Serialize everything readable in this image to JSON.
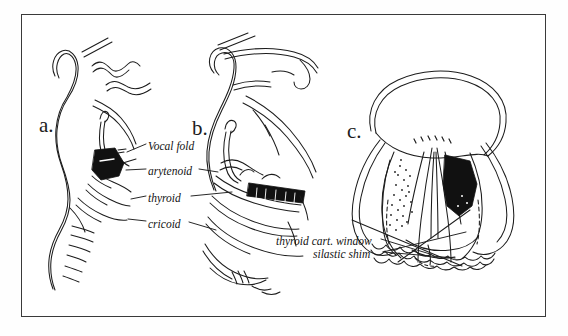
{
  "figure": {
    "domain": "medical-illustration",
    "background_color": "#ffffff",
    "frame_color": "#3a3a3a",
    "ink_color": "#1c1c1c",
    "fill_color": "#111111"
  },
  "panels": [
    {
      "id": "a",
      "letter": "a.",
      "view": "sagittal-small",
      "description": "Midsagittal section of head and neck showing larynx with darkened arytenoid region"
    },
    {
      "id": "b",
      "letter": "b.",
      "view": "sagittal-large",
      "description": "Enlarged sagittal view of the larynx with black rectangular thyroid cartilage window implant"
    },
    {
      "id": "c",
      "letter": "c.",
      "view": "superior",
      "description": "Superior (top-down) view of the larynx showing vocal folds, stippled left fold and solid black silastic shim on the right"
    }
  ],
  "annotations": [
    {
      "id": "vocal-fold",
      "text": "Vocal fold",
      "points_to": "panel-a-arytenoid"
    },
    {
      "id": "arytenoid",
      "text": "arytenoid",
      "points_to": "panel-a-arytenoid"
    },
    {
      "id": "thyroid",
      "text": "thyroid",
      "points_to": "panel-b-thyroid-cartilage"
    },
    {
      "id": "cricoid",
      "text": "cricoid",
      "points_to": "panel-b-cricoid-cartilage"
    },
    {
      "id": "thyroid-cart-window",
      "text": "thyroid cart. window",
      "points_to": "panel-c-window"
    },
    {
      "id": "silastic-shim",
      "text": "silastic shim",
      "points_to": "panel-c-shim"
    }
  ]
}
